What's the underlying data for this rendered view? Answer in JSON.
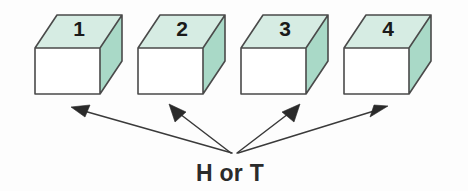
{
  "figure": {
    "background_color": "#fdfdfd",
    "caption": "H or T",
    "caption_position": {
      "x": 230,
      "y": 180
    },
    "convergence_point": {
      "x": 234,
      "y": 156
    }
  },
  "style": {
    "front_face_color": "#ffffff",
    "top_face_color": "#d6ece3",
    "side_face_color": "#a9d9c7",
    "edge_color": "#4a4a4a",
    "arrow_color": "#2a2a2a",
    "text_color": "#2b2b2b"
  },
  "boxes": [
    {
      "label": "1",
      "name": "box-1",
      "front": {
        "x": 35,
        "y": 48,
        "w": 65,
        "h": 46
      },
      "depth": {
        "dx": 22,
        "dy": -33
      },
      "label_pos": {
        "x": 79,
        "y": 36
      },
      "arrow": {
        "tip_x": 72,
        "tip_y": 107
      }
    },
    {
      "label": "2",
      "name": "box-2",
      "front": {
        "x": 138,
        "y": 48,
        "w": 65,
        "h": 46
      },
      "depth": {
        "dx": 22,
        "dy": -33
      },
      "label_pos": {
        "x": 182,
        "y": 36
      },
      "arrow": {
        "tip_x": 170,
        "tip_y": 104
      }
    },
    {
      "label": "3",
      "name": "box-3",
      "front": {
        "x": 241,
        "y": 48,
        "w": 65,
        "h": 46
      },
      "depth": {
        "dx": 22,
        "dy": -33
      },
      "label_pos": {
        "x": 285,
        "y": 36
      },
      "arrow": {
        "tip_x": 299,
        "tip_y": 104
      }
    },
    {
      "label": "4",
      "name": "box-4",
      "front": {
        "x": 344,
        "y": 48,
        "w": 65,
        "h": 46
      },
      "depth": {
        "dx": 22,
        "dy": -33
      },
      "label_pos": {
        "x": 388,
        "y": 36
      },
      "arrow": {
        "tip_x": 387,
        "tip_y": 106
      }
    }
  ]
}
